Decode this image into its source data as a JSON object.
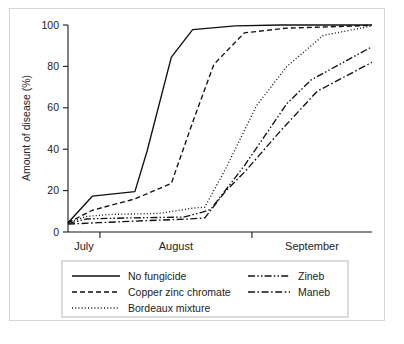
{
  "figure": {
    "background_color": "#ffffff",
    "frame_color": "#d6d6d6",
    "line_color": "#101010"
  },
  "chart_data": {
    "type": "line",
    "title": "",
    "xlabel": "",
    "ylabel": "Amount of disease (%)",
    "ylim": [
      0,
      100
    ],
    "yticks": [
      0,
      20,
      40,
      60,
      80,
      100
    ],
    "ytick_labels": [
      "0",
      "20",
      "40",
      "60",
      "80",
      "100"
    ],
    "xlim": [
      0,
      100
    ],
    "categories": [
      "July",
      "August",
      "September"
    ],
    "category_tick_positions": [
      10.5,
      60.5
    ],
    "grid": false,
    "legend_position": "below-axes",
    "series": [
      {
        "name": "No fungicide",
        "style": "solid",
        "x": [
          0,
          8,
          22,
          26,
          34,
          41,
          55,
          70,
          100
        ],
        "values": [
          4.5,
          17.3,
          19.5,
          39,
          84.5,
          97.8,
          99.6,
          100,
          100
        ]
      },
      {
        "name": "Copper zinc chromate",
        "style": "dashed",
        "x": [
          0,
          8,
          22,
          30,
          34,
          41,
          48,
          58,
          72,
          100
        ],
        "values": [
          4.5,
          10.5,
          16,
          21,
          23.5,
          53,
          81,
          96.2,
          98.5,
          99.8
        ]
      },
      {
        "name": "Bordeaux mixture",
        "style": "dotted",
        "x": [
          0,
          6,
          14,
          30,
          41,
          45,
          52,
          62,
          72,
          84,
          100
        ],
        "values": [
          4.5,
          7.5,
          8.5,
          9,
          11.5,
          12,
          31,
          61,
          80,
          95,
          99.5
        ]
      },
      {
        "name": "Zineb",
        "style": "dash-dot-dot",
        "x": [
          0,
          6,
          20,
          38,
          44,
          47,
          58,
          72,
          80,
          100
        ],
        "values": [
          4.0,
          6.3,
          6.8,
          7.2,
          9.5,
          11,
          32,
          62,
          73.5,
          89.5
        ]
      },
      {
        "name": "Maneb",
        "style": "dash-dot",
        "x": [
          0,
          10,
          26,
          40,
          45,
          52,
          58,
          70,
          82,
          100
        ],
        "values": [
          3.8,
          4.5,
          5.5,
          6.3,
          6.8,
          20,
          28.8,
          49,
          68,
          82
        ]
      }
    ]
  },
  "legend": {
    "entries": [
      {
        "label": "No fungicide",
        "style": "solid",
        "column": 0
      },
      {
        "label": "Copper zinc chromate",
        "style": "dashed",
        "column": 0
      },
      {
        "label": "Bordeaux mixture",
        "style": "dotted",
        "column": 0
      },
      {
        "label": "Zineb",
        "style": "dash-dot-dot",
        "column": 1
      },
      {
        "label": "Maneb",
        "style": "dash-dot",
        "column": 1
      }
    ]
  }
}
